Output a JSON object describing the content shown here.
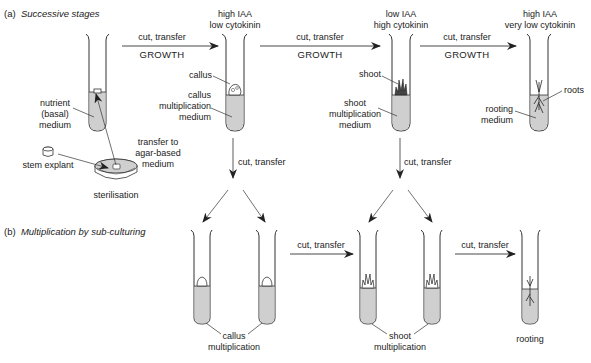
{
  "sections": {
    "a": {
      "marker": "(a)",
      "title": "Successive stages"
    },
    "b": {
      "marker": "(b)",
      "title": "Multiplication by sub-culturing"
    }
  },
  "stage_a": {
    "arrow_label": "cut, transfer",
    "growth_label": "GROWTH",
    "down_arrow_label": "cut, transfer",
    "tube1": {
      "medium_label": [
        "nutrient",
        "(basal)",
        "medium"
      ]
    },
    "explant": {
      "label": "stem explant"
    },
    "dish": {
      "label": "sterilisation",
      "transfer_label": [
        "transfer to",
        "agar-based",
        "medium"
      ]
    },
    "tube2": {
      "header": [
        "high IAA",
        "low cytokinin"
      ],
      "tissue_label": "callus",
      "medium_label": [
        "callus",
        "multiplication",
        "medium"
      ]
    },
    "tube3": {
      "header": [
        "low IAA",
        "high cytokinin"
      ],
      "tissue_label": "shoot",
      "medium_label": [
        "shoot",
        "multiplication",
        "medium"
      ]
    },
    "tube4": {
      "header": [
        "high IAA",
        "very low  cytokinin"
      ],
      "tissue_label": "roots",
      "medium_label": [
        "rooting",
        "medium"
      ]
    }
  },
  "stage_b": {
    "arrow_label": "cut, transfer",
    "group1": [
      "callus",
      "multiplication"
    ],
    "group2": [
      "shoot",
      "multiplication"
    ],
    "group3": "rooting"
  },
  "colors": {
    "medium_fill": "#cfcfcf",
    "line": "#333333"
  }
}
